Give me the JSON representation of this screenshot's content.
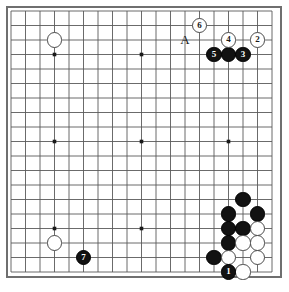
{
  "diagram": {
    "board_size": 19,
    "grid": {
      "origin_x": 11,
      "origin_y": 11,
      "spacing": 14.5,
      "line_color": "#5a5a5a",
      "border_color": "#6f6f6f",
      "background": "#ffffff",
      "star_points": [
        {
          "col": 4,
          "row": 4
        },
        {
          "col": 10,
          "row": 4
        },
        {
          "col": 16,
          "row": 4
        },
        {
          "col": 4,
          "row": 10
        },
        {
          "col": 10,
          "row": 10
        },
        {
          "col": 16,
          "row": 10
        },
        {
          "col": 4,
          "row": 16
        },
        {
          "col": 10,
          "row": 16
        },
        {
          "col": 16,
          "row": 16
        }
      ]
    },
    "colors": {
      "black_stone": "#121212",
      "white_stone": "#ffffff",
      "stone_outline": "#4a4a4a",
      "label_text": "#1a1a1a"
    },
    "labels": [
      {
        "text": "A",
        "col": 13,
        "row": 3,
        "name": "point-label-a"
      }
    ],
    "stones": [
      {
        "col": 4,
        "row": 3,
        "color": "white",
        "label": "",
        "name": "stone-white-d17"
      },
      {
        "col": 14,
        "row": 2,
        "color": "white",
        "label": "6",
        "name": "stone-white-move-6"
      },
      {
        "col": 16,
        "row": 3,
        "color": "white",
        "label": "4",
        "name": "stone-white-move-4"
      },
      {
        "col": 18,
        "row": 3,
        "color": "white",
        "label": "2",
        "name": "stone-white-move-2"
      },
      {
        "col": 15,
        "row": 4,
        "color": "black",
        "label": "5",
        "name": "stone-black-move-5"
      },
      {
        "col": 16,
        "row": 4,
        "color": "black",
        "label": "",
        "name": "stone-black-q16"
      },
      {
        "col": 17,
        "row": 4,
        "color": "black",
        "label": "3",
        "name": "stone-black-move-3"
      },
      {
        "col": 17,
        "row": 14,
        "color": "black",
        "label": "",
        "name": "stone-black-r6-upper"
      },
      {
        "col": 16,
        "row": 15,
        "color": "black",
        "label": "",
        "name": "stone-black-q5a"
      },
      {
        "col": 18,
        "row": 15,
        "color": "black",
        "label": "",
        "name": "stone-black-s5"
      },
      {
        "col": 16,
        "row": 16,
        "color": "black",
        "label": "",
        "name": "stone-black-q4"
      },
      {
        "col": 17,
        "row": 16,
        "color": "black",
        "label": "",
        "name": "stone-black-r4"
      },
      {
        "col": 18,
        "row": 16,
        "color": "white",
        "label": "",
        "name": "stone-white-s4"
      },
      {
        "col": 16,
        "row": 17,
        "color": "black",
        "label": "",
        "name": "stone-black-q3"
      },
      {
        "col": 17,
        "row": 17,
        "color": "white",
        "label": "",
        "name": "stone-white-r3"
      },
      {
        "col": 18,
        "row": 17,
        "color": "white",
        "label": "",
        "name": "stone-white-s3"
      },
      {
        "col": 15,
        "row": 18,
        "color": "black",
        "label": "",
        "name": "stone-black-p2"
      },
      {
        "col": 16,
        "row": 18,
        "color": "white",
        "label": "",
        "name": "stone-white-q2"
      },
      {
        "col": 18,
        "row": 18,
        "color": "white",
        "label": "",
        "name": "stone-white-s2"
      },
      {
        "col": 16,
        "row": 19,
        "color": "black",
        "label": "1",
        "name": "stone-black-move-1"
      },
      {
        "col": 17,
        "row": 19,
        "color": "white",
        "label": "",
        "name": "stone-white-r1"
      },
      {
        "col": 4,
        "row": 17,
        "color": "white",
        "label": "",
        "name": "stone-white-d3"
      },
      {
        "col": 6,
        "row": 18,
        "color": "black",
        "label": "7",
        "name": "stone-black-move-7"
      }
    ]
  }
}
